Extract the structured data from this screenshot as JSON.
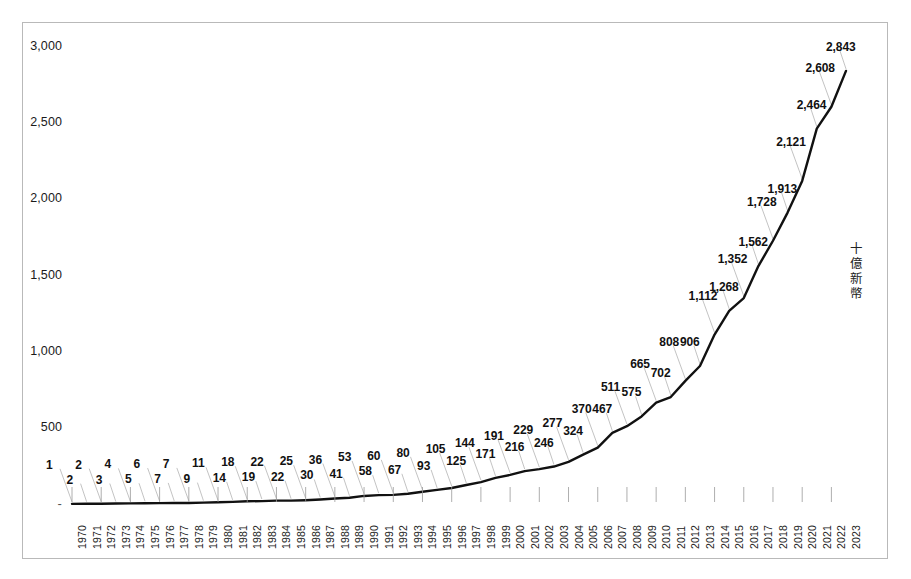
{
  "chart_data": {
    "type": "line",
    "title": "",
    "subtitle": "",
    "xlabel": "",
    "ylabel": "十億新幣",
    "ylim": [
      0,
      3000
    ],
    "yticks": [
      "-",
      "500",
      "1,000",
      "1,500",
      "2,000",
      "2,500",
      "3,000"
    ],
    "ytick_values": [
      0,
      500,
      1000,
      1500,
      2000,
      2500,
      3000
    ],
    "grid": false,
    "legend": null,
    "data_labels": true,
    "line_color": "#111111",
    "frame_color": "#b9b9b9",
    "categories": [
      "1970",
      "1971",
      "1972",
      "1973",
      "1974",
      "1975",
      "1976",
      "1977",
      "1978",
      "1979",
      "1980",
      "1981",
      "1982",
      "1983",
      "1984",
      "1985",
      "1986",
      "1987",
      "1988",
      "1989",
      "1990",
      "1991",
      "1992",
      "1993",
      "1994",
      "1995",
      "1996",
      "1997",
      "1998",
      "1999",
      "2000",
      "2001",
      "2002",
      "2003",
      "2004",
      "2005",
      "2006",
      "2007",
      "2008",
      "2009",
      "2010",
      "2011",
      "2012",
      "2013",
      "2014",
      "2015",
      "2016",
      "2017",
      "2018",
      "2019",
      "2020",
      "2021",
      "2022",
      "2023"
    ],
    "values": [
      1,
      2,
      2,
      3,
      4,
      5,
      6,
      7,
      7,
      9,
      11,
      14,
      18,
      19,
      22,
      22,
      25,
      30,
      36,
      41,
      53,
      58,
      60,
      67,
      80,
      93,
      105,
      125,
      144,
      171,
      191,
      216,
      229,
      246,
      277,
      324,
      370,
      467,
      511,
      575,
      665,
      702,
      808,
      906,
      1112,
      1268,
      1352,
      1562,
      1728,
      1913,
      2121,
      2464,
      2608,
      2843
    ],
    "value_labels": [
      "1",
      "2",
      "2",
      "3",
      "4",
      "5",
      "6",
      "7",
      "7",
      "9",
      "11",
      "14",
      "18",
      "19",
      "22",
      "22",
      "25",
      "30",
      "36",
      "41",
      "53",
      "58",
      "60",
      "67",
      "80",
      "93",
      "105",
      "125",
      "144",
      "171",
      "191",
      "216",
      "229",
      "246",
      "277",
      "324",
      "370",
      "467",
      "511",
      "575",
      "665",
      "702",
      "808",
      "906",
      "1,112",
      "1,268",
      "1,352",
      "1,562",
      "1,728",
      "1,913",
      "2,121",
      "2,464",
      "2,608",
      "2,843"
    ]
  },
  "caption": {
    "text": ""
  }
}
